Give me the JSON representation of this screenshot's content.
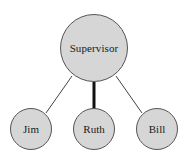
{
  "diagram": {
    "type": "organization-tree",
    "background_color": "#ffffff",
    "node_fill_color": "#d6d6d6",
    "node_stroke_color": "#555555",
    "edge_color": "#444444",
    "nodes": [
      {
        "id": "supervisor",
        "label": "Supervisor",
        "role": "root",
        "cx": 94,
        "cy": 48,
        "r": 34
      },
      {
        "id": "jim",
        "label": "Jim",
        "role": "leaf",
        "cx": 31,
        "cy": 129,
        "r": 21
      },
      {
        "id": "ruth",
        "label": "Ruth",
        "role": "leaf",
        "cx": 94,
        "cy": 129,
        "r": 21
      },
      {
        "id": "bill",
        "label": "Bill",
        "role": "leaf",
        "cx": 94,
        "cy": 129,
        "r": 21
      }
    ],
    "edges": [
      {
        "id": "edge-supervisor-jim",
        "from": "supervisor",
        "to": "jim",
        "style": "thin",
        "width": 1,
        "x1": 72,
        "y1": 76,
        "x2": 46,
        "y2": 113
      },
      {
        "id": "edge-supervisor-ruth",
        "from": "supervisor",
        "to": "ruth",
        "style": "thick",
        "width": 3,
        "x1": 94,
        "y1": 82,
        "x2": 94,
        "y2": 108
      },
      {
        "id": "edge-supervisor-bill",
        "from": "supervisor",
        "to": "bill",
        "style": "thin",
        "width": 1,
        "x1": 116,
        "y1": 76,
        "x2": 142,
        "y2": 113
      }
    ]
  }
}
